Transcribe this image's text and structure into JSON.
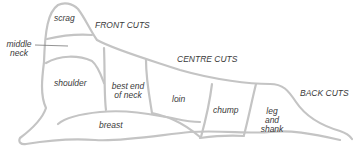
{
  "diagram": {
    "sections": {
      "front": "FRONT CUTS",
      "centre": "CENTRE CUTS",
      "back": "BACK CUTS"
    },
    "cuts": {
      "scrag": "scrag",
      "middle_neck_1": "middle",
      "middle_neck_2": "neck",
      "shoulder": "shoulder",
      "best_end_1": "best end",
      "best_end_2": "of neck",
      "loin": "loin",
      "chump": "chump",
      "leg_1": "leg",
      "leg_2": "and",
      "leg_3": "shank",
      "breast": "breast"
    },
    "colors": {
      "outline": "#bdbdbd",
      "text": "#3a3a3a"
    }
  }
}
